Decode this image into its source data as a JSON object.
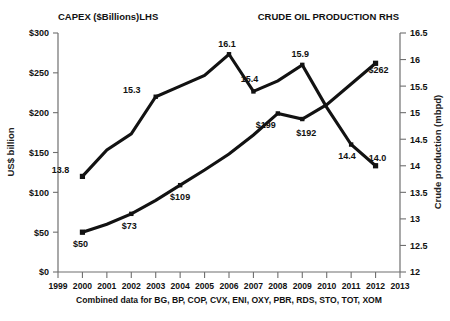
{
  "header": {
    "left_title": "CAPEX ($Billions)LHS",
    "right_title": "CRUDE OIL PRODUCTION RHS"
  },
  "footnote": "Combined data for BG, BP, COP, CVX, ENI, OXY, PBR, RDS, STO, TOT, XOM",
  "axes": {
    "y_left_label": "US$ billion",
    "y_right_label": "Crude production (mbpd)",
    "x_label": ""
  },
  "chart_data": {
    "type": "line",
    "title": "",
    "subtitle": "",
    "xlabel": "",
    "ylabel": "US$ billion",
    "y2label": "Crude production (mbpd)",
    "grid": false,
    "legend_position": "top",
    "x": [
      1999,
      2000,
      2001,
      2002,
      2003,
      2004,
      2005,
      2006,
      2007,
      2008,
      2009,
      2010,
      2011,
      2012,
      2013
    ],
    "xlim": [
      1999,
      2013
    ],
    "xticks": [
      "1999",
      "2000",
      "2001",
      "2002",
      "2003",
      "2004",
      "2005",
      "2006",
      "2007",
      "2008",
      "2009",
      "2010",
      "2011",
      "2012",
      "2013"
    ],
    "ylim": [
      0,
      300
    ],
    "yticks": [
      "$0",
      "$50",
      "$100",
      "$150",
      "$200",
      "$250",
      "$300"
    ],
    "ytick_values": [
      0,
      50,
      100,
      150,
      200,
      250,
      300
    ],
    "y2lim": [
      12,
      16.5
    ],
    "y2ticks": [
      "12",
      "12.5",
      "13",
      "13.5",
      "14",
      "14.5",
      "15",
      "15.5",
      "16",
      "16.5"
    ],
    "y2tick_values": [
      12,
      12.5,
      13,
      13.5,
      14,
      14.5,
      15,
      15.5,
      16,
      16.5
    ],
    "series": [
      {
        "name": "CAPEX ($Billions)LHS",
        "axis": "left",
        "x": [
          2000,
          2001,
          2002,
          2003,
          2004,
          2005,
          2006,
          2007,
          2008,
          2009,
          2010,
          2011,
          2012
        ],
        "values": [
          50,
          60,
          73,
          90,
          109,
          128,
          148,
          172,
          199,
          192,
          210,
          236,
          262
        ],
        "labels": [
          {
            "x": 2000,
            "value": 50,
            "text": "$50",
            "dx": -2,
            "dy": 15
          },
          {
            "x": 2002,
            "value": 73,
            "text": "$73",
            "dx": -2,
            "dy": 15
          },
          {
            "x": 2004,
            "value": 109,
            "text": "$109",
            "dx": 0,
            "dy": 15
          },
          {
            "x": 2008,
            "value": 199,
            "text": "$199",
            "dx": -12,
            "dy": 15
          },
          {
            "x": 2009,
            "value": 192,
            "text": "$192",
            "dx": 4,
            "dy": 17
          },
          {
            "x": 2012,
            "value": 262,
            "text": "$262",
            "dx": 3,
            "dy": 10
          }
        ]
      },
      {
        "name": "CRUDE OIL PRODUCTION RHS",
        "axis": "right",
        "x": [
          2000,
          2001,
          2002,
          2003,
          2004,
          2005,
          2006,
          2007,
          2008,
          2009,
          2010,
          2011,
          2012
        ],
        "values": [
          13.8,
          14.3,
          14.6,
          15.3,
          15.5,
          15.7,
          16.1,
          15.4,
          15.6,
          15.9,
          15.1,
          14.4,
          14.0
        ],
        "labels": [
          {
            "x": 2000,
            "value": 13.8,
            "text": "13.8",
            "dx": -22,
            "dy": -3
          },
          {
            "x": 2003,
            "value": 15.3,
            "text": "15.3",
            "dx": -24,
            "dy": -4
          },
          {
            "x": 2006,
            "value": 16.1,
            "text": "16.1",
            "dx": -2,
            "dy": -7
          },
          {
            "x": 2007,
            "value": 15.4,
            "text": "15.4",
            "dx": -4,
            "dy": -9
          },
          {
            "x": 2009,
            "value": 15.9,
            "text": "15.9",
            "dx": -2,
            "dy": -8
          },
          {
            "x": 2011,
            "value": 14.4,
            "text": "14.4",
            "dx": -4,
            "dy": 14
          },
          {
            "x": 2012,
            "value": 14.0,
            "text": "14.0",
            "dx": 2,
            "dy": -5
          }
        ]
      }
    ]
  }
}
